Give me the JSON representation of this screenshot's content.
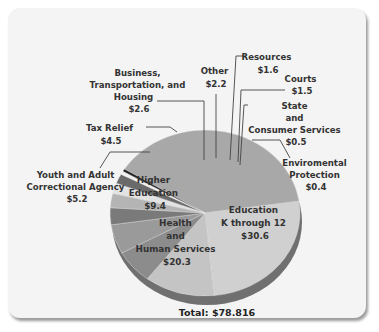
{
  "chart_data": {
    "type": "pie",
    "title": "",
    "total_label": "Total: $78.816",
    "units": "billions of dollars",
    "slices": [
      {
        "name": "Education K through 12",
        "label_lines": [
          "Education",
          "K through 12",
          "$30.6"
        ],
        "value": 30.6,
        "color": "#a8a8a8"
      },
      {
        "name": "Health and Human Services",
        "label_lines": [
          "Health",
          "and",
          "Human Services",
          "$20.3"
        ],
        "value": 20.3,
        "color": "#d0d0d0"
      },
      {
        "name": "Higher Education",
        "label_lines": [
          "Higher",
          "Education",
          "$9.4"
        ],
        "value": 9.4,
        "color": "#c4c4c4"
      },
      {
        "name": "Youth and Adult Correctional Agency",
        "label_lines": [
          "Youth and Adult",
          "Correctional Agency",
          "$5.2"
        ],
        "value": 5.2,
        "color": "#8c8c8c"
      },
      {
        "name": "Tax Relief",
        "label_lines": [
          "Tax Relief",
          "$4.5"
        ],
        "value": 4.5,
        "color": "#9a9a9a"
      },
      {
        "name": "Business, Transportation, and Housing",
        "label_lines": [
          "Business,",
          "Transportation, and",
          "Housing",
          "$2.6"
        ],
        "value": 2.6,
        "color": "#7a7a7a"
      },
      {
        "name": "Other",
        "label_lines": [
          "Other",
          "$2.2"
        ],
        "value": 2.2,
        "color": "#b4b4b4"
      },
      {
        "name": "Resources",
        "label_lines": [
          "Resources",
          "$1.6"
        ],
        "value": 1.6,
        "color": "#e2e2e2"
      },
      {
        "name": "Courts",
        "label_lines": [
          "Courts",
          "$1.5"
        ],
        "value": 1.5,
        "color": "#6a6a6a"
      },
      {
        "name": "State and Consumer Services",
        "label_lines": [
          "State",
          "and",
          "Consumer Services",
          "$0.5"
        ],
        "value": 0.5,
        "color": "#f0f0f0"
      },
      {
        "name": "Enviromental Protection",
        "label_lines": [
          "Enviromental",
          "Protection",
          "$0.4"
        ],
        "value": 0.4,
        "color": "#222222"
      }
    ],
    "legend": "none (direct labels with leader lines)"
  },
  "labels": {
    "business": [
      "Business,",
      "Transportation, and",
      "Housing",
      "$2.6"
    ],
    "tax": [
      "Tax Relief",
      "$4.5"
    ],
    "youth": [
      "Youth and Adult",
      "Correctional Agency",
      "$5.2"
    ],
    "higher": [
      "Higher",
      "Education",
      "$9.4"
    ],
    "health": [
      "Health",
      "and",
      "Human Services",
      "$20.3"
    ],
    "k12": [
      "Education",
      "K through 12",
      "$30.6"
    ],
    "other": [
      "Other",
      "$2.2"
    ],
    "resources": [
      "Resources",
      "$1.6"
    ],
    "courts": [
      "Courts",
      "$1.5"
    ],
    "state": [
      "State",
      "and",
      "Consumer Services",
      "$0.5"
    ],
    "env": [
      "Enviromental",
      "Protection",
      "$0.4"
    ],
    "total": "Total: $78.816"
  }
}
